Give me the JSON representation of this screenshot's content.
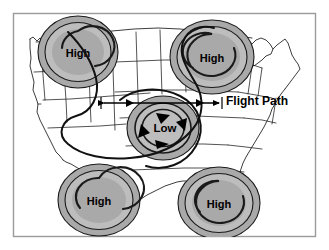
{
  "figure": {
    "width": 329,
    "height": 250,
    "background_color": "#ffffff",
    "frame_color": "#9a9a9a"
  },
  "colors": {
    "ring_gray": "#a9a9a9",
    "ring_gray_light": "#bdbdbd",
    "map_outline": "#1a1a1a",
    "map_fill": "#ffffff",
    "ink": "#000000",
    "frame": "#9a9a9a"
  },
  "map": {
    "name": "united-states-outline",
    "fill": "#ffffff",
    "stroke": "#1a1a1a"
  },
  "pressure_systems": [
    {
      "id": "high-northwest",
      "type": "high",
      "label": "High",
      "cx": 78,
      "cy": 52,
      "rx": 40,
      "ry": 36
    },
    {
      "id": "high-northeast",
      "type": "high",
      "label": "High",
      "cx": 212,
      "cy": 57,
      "rx": 42,
      "ry": 37
    },
    {
      "id": "high-southwest",
      "type": "high",
      "label": "High",
      "cx": 99,
      "cy": 200,
      "rx": 41,
      "ry": 36
    },
    {
      "id": "high-southeast",
      "type": "high",
      "label": "High",
      "cx": 219,
      "cy": 203,
      "rx": 41,
      "ry": 36
    },
    {
      "id": "low-center",
      "type": "low",
      "label": "Low",
      "cx": 163,
      "cy": 128,
      "rx": 36,
      "ry": 32
    }
  ],
  "flight_path": {
    "label": "Flight Path",
    "label_x": 226,
    "label_y": 101,
    "line_y": 103,
    "line_x_start": 101,
    "line_x_end": 222,
    "direction": "bidirectional"
  },
  "rotation_arrows": {
    "system": "low-center",
    "direction": "counterclockwise",
    "count": 4
  },
  "legend": {
    "high_label": "High",
    "low_label": "Low",
    "flight_path_label": "Flight Path"
  }
}
